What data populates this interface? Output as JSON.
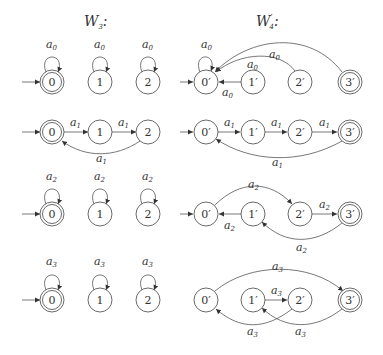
{
  "titles": {
    "left": "W",
    "left_sub": "3",
    "left_suffix": ":",
    "right": "W",
    "right_prime": "′",
    "right_sub": "4",
    "right_suffix": ":"
  },
  "left_states": [
    "0",
    "1",
    "2"
  ],
  "right_states": [
    "0′",
    "1′",
    "2′",
    "3′"
  ],
  "left_accepting": "0",
  "right_accepting": "3′",
  "labels": {
    "a0": "a",
    "a0_sub": "0",
    "a1": "a",
    "a1_sub": "1",
    "a2": "a",
    "a2_sub": "2",
    "a3": "a",
    "a3_sub": "3"
  },
  "rows": [
    {
      "symbol": "a0",
      "left_transitions": [
        [
          "0",
          "0"
        ],
        [
          "1",
          "1"
        ],
        [
          "2",
          "2"
        ]
      ],
      "right_transitions": [
        [
          "0′",
          "0′"
        ],
        [
          "1′",
          "0′"
        ],
        [
          "2′",
          "0′"
        ],
        [
          "3′",
          "0′"
        ]
      ]
    },
    {
      "symbol": "a1",
      "left_transitions": [
        [
          "0",
          "1"
        ],
        [
          "1",
          "2"
        ],
        [
          "2",
          "0"
        ]
      ],
      "right_transitions": [
        [
          "0′",
          "1′"
        ],
        [
          "1′",
          "2′"
        ],
        [
          "2′",
          "3′"
        ],
        [
          "3′",
          "0′"
        ]
      ]
    },
    {
      "symbol": "a2",
      "left_transitions": [
        [
          "0",
          "0"
        ],
        [
          "1",
          "1"
        ],
        [
          "2",
          "2"
        ]
      ],
      "right_transitions": [
        [
          "0′",
          "2′"
        ],
        [
          "1′",
          "0′"
        ],
        [
          "2′",
          "3′"
        ],
        [
          "3′",
          "1′"
        ]
      ]
    },
    {
      "symbol": "a3",
      "left_transitions": [
        [
          "0",
          "0"
        ],
        [
          "1",
          "1"
        ],
        [
          "2",
          "2"
        ]
      ],
      "right_transitions": [
        [
          "0′",
          "3′"
        ],
        [
          "1′",
          "2′"
        ],
        [
          "2′",
          "0′"
        ],
        [
          "3′",
          "1′"
        ]
      ]
    }
  ]
}
